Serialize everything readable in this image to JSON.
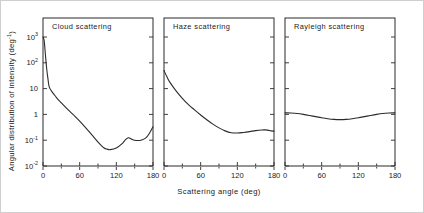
{
  "figure": {
    "xlabel": "Scattering angle (deg)",
    "ylabel_main": "Angular distribution of intensity (deg",
    "ylabel_sup": "-1",
    "ylabel_close": ")"
  },
  "axes": {
    "x_ticks": [
      "0",
      "60",
      "120",
      "180"
    ],
    "x_tick_values": [
      0,
      60,
      120,
      180
    ],
    "x_minor_values": [
      30,
      90,
      150
    ],
    "xlim": [
      0,
      180
    ],
    "y_tick_labels": [
      "10",
      "10",
      "10",
      "1",
      "10",
      "10"
    ],
    "y_tick_sups": [
      "3",
      "2",
      "",
      "",
      "-1",
      "-2"
    ],
    "y_tick_exponents": [
      3,
      2,
      1,
      0,
      -1,
      -2
    ],
    "ylim_exponents": [
      -2,
      3
    ],
    "grid": "off",
    "legend": "none"
  },
  "chart_data": {
    "type": "line",
    "title": "",
    "xlabel": "Scattering angle (deg)",
    "ylabel": "Angular distribution of intensity (deg^-1)",
    "yscale": "log",
    "xlim": [
      0,
      180
    ],
    "ylim": [
      0.01,
      1000
    ],
    "panels": [
      {
        "title": "Cloud scattering",
        "x": [
          0,
          2,
          4,
          6,
          8,
          10,
          14,
          18,
          22,
          26,
          30,
          40,
          50,
          60,
          70,
          80,
          90,
          100,
          105,
          110,
          120,
          130,
          135,
          140,
          145,
          150,
          155,
          160,
          165,
          170,
          175,
          180
        ],
        "y": [
          1000,
          700,
          200,
          60,
          25,
          12,
          8.0,
          6.0,
          4.5,
          3.5,
          2.8,
          1.6,
          0.95,
          0.55,
          0.3,
          0.16,
          0.085,
          0.05,
          0.045,
          0.043,
          0.05,
          0.075,
          0.105,
          0.125,
          0.11,
          0.1,
          0.098,
          0.1,
          0.11,
          0.135,
          0.2,
          0.33
        ]
      },
      {
        "title": "Haze scattering",
        "x": [
          0,
          5,
          10,
          20,
          30,
          40,
          50,
          60,
          70,
          80,
          90,
          100,
          110,
          120,
          130,
          140,
          150,
          160,
          165,
          170,
          175,
          180
        ],
        "y": [
          50,
          28,
          17,
          8.0,
          4.2,
          2.4,
          1.5,
          0.95,
          0.62,
          0.42,
          0.3,
          0.23,
          0.195,
          0.19,
          0.2,
          0.215,
          0.235,
          0.25,
          0.252,
          0.245,
          0.23,
          0.225
        ]
      },
      {
        "title": "Rayleigh scattering",
        "x": [
          0,
          10,
          20,
          30,
          40,
          50,
          60,
          70,
          80,
          90,
          100,
          110,
          120,
          130,
          140,
          150,
          160,
          170,
          180
        ],
        "y": [
          1.15,
          1.13,
          1.08,
          1.0,
          0.91,
          0.82,
          0.74,
          0.68,
          0.64,
          0.625,
          0.64,
          0.68,
          0.74,
          0.82,
          0.91,
          1.0,
          1.08,
          1.13,
          1.15
        ]
      }
    ]
  }
}
